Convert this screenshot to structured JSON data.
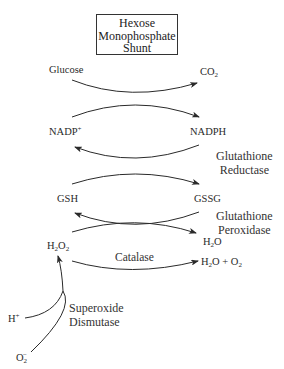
{
  "title_box": {
    "lines": [
      "Hexose",
      "Monophosphate",
      "Shunt"
    ]
  },
  "metabolites": {
    "glucose": "Glucose",
    "co2": {
      "base": "CO",
      "sub": "2"
    },
    "nadp_plus": {
      "base": "NADP",
      "sup": "+"
    },
    "nadph": "NADPH",
    "gsh": "GSH",
    "gssg": "GSSG",
    "h2o2": {
      "a": "H",
      "a_sub": "2",
      "b": "O",
      "b_sub": "2"
    },
    "h2o": {
      "a": "H",
      "a_sub": "2",
      "b": "O"
    },
    "h2o_o2": {
      "a": "H",
      "a_sub": "2",
      "b": "O + O",
      "b_sub": "2"
    },
    "h_plus": {
      "base": "H",
      "sup": "+"
    },
    "superoxide": {
      "base": "O",
      "sub": "2",
      "sup": "−"
    }
  },
  "enzymes": {
    "glutathione_reductase": [
      "Glutathione",
      "Reductase"
    ],
    "glutathione_peroxidase": [
      "Glutathione",
      "Peroxidase"
    ],
    "catalase": "Catalase",
    "superoxide_dismutase": [
      "Superoxide",
      "Dismutase"
    ]
  },
  "colors": {
    "line": "#2a2a2a",
    "text": "#2a2a2a",
    "background": "#ffffff"
  }
}
